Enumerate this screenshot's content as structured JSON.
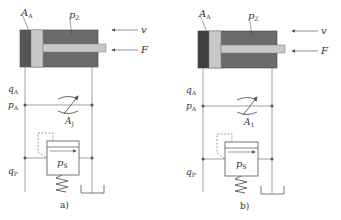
{
  "figure": {
    "panels": [
      {
        "id": "a",
        "caption": "a)",
        "cylinder_left_chamber_color": "#555555",
        "labels": {
          "area_A": "A",
          "area_A_sub": "A",
          "pressure_z": "p",
          "pressure_z_sub": "Z",
          "velocity": "v",
          "force": "F",
          "flow_A": "q",
          "flow_A_sub": "A",
          "pressure_A": "p",
          "pressure_A_sub": "A",
          "throttle_area": "A",
          "throttle_area_sub": "J",
          "relief_pressure": "p",
          "relief_pressure_sub": "S",
          "flow_pump": "q",
          "flow_pump_sub": "P"
        }
      },
      {
        "id": "b",
        "caption": "b)",
        "cylinder_left_chamber_color": "#3f3f3f",
        "labels": {
          "area_A": "A",
          "area_A_sub": "A",
          "pressure_z": "p",
          "pressure_z_sub": "Z",
          "velocity": "v",
          "force": "F",
          "flow_A": "q",
          "flow_A_sub": "A",
          "pressure_A": "p",
          "pressure_A_sub": "A",
          "throttle_area": "A",
          "throttle_area_sub": "1",
          "relief_pressure": "p",
          "relief_pressure_sub": "S",
          "flow_pump": "q",
          "flow_pump_sub": "P"
        }
      }
    ],
    "colors": {
      "cylinder_body": "#6b6b6b",
      "piston": "#c8c8c8",
      "rod": "#c8c8c8",
      "line": "#777777"
    }
  }
}
